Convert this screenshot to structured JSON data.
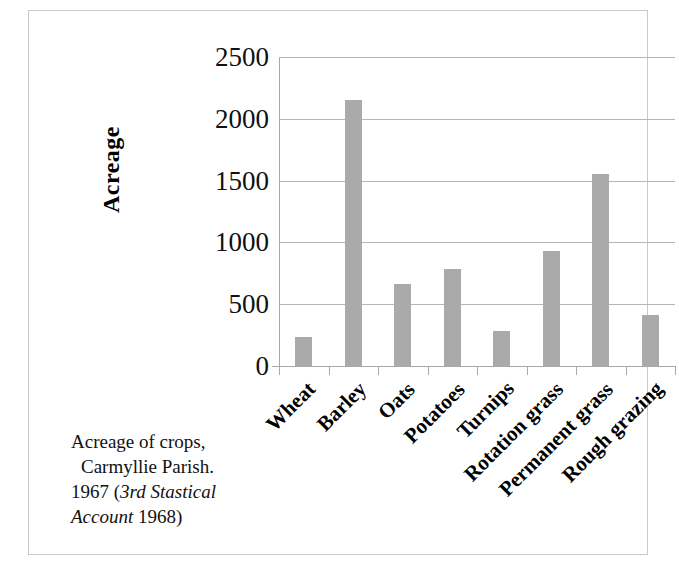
{
  "caption": {
    "line1": "Acreage of crops,",
    "line2": "Carmyllie Parish.",
    "line3_plain": "1967 (",
    "line3_italic": "3rd Stastical",
    "line4_italic": "Account",
    "line4_plain": " 1968)"
  },
  "chart_data": {
    "type": "bar",
    "title": "",
    "categories": [
      "Wheat",
      "Barley",
      "Oats",
      "Potatoes",
      "Turnips",
      "Rotation grass",
      "Permanent grass",
      "Rough grazing"
    ],
    "values": [
      235,
      2150,
      660,
      785,
      285,
      930,
      1550,
      415
    ],
    "xlabel": "",
    "ylabel": "Acreage",
    "ylim": [
      0,
      2500
    ],
    "ytick_labels": [
      "2500",
      "2000",
      "1500",
      "1000",
      "500",
      "0"
    ],
    "ytick_values": [
      2500,
      2000,
      1500,
      1000,
      500,
      0
    ],
    "grid": true,
    "legend": false,
    "bar_color": "#aaaaaa",
    "gridline_color": "#b6b6b6",
    "axis_color": "#a8a8a8",
    "text_color": "#111111"
  }
}
